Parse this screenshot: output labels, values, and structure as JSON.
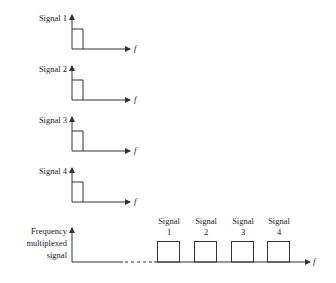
{
  "signals": [
    {
      "label": "Signal 1",
      "axis_label": "f"
    },
    {
      "label": "Signal 2",
      "axis_label": "f"
    },
    {
      "label": "Signal 3",
      "axis_label": "f"
    },
    {
      "label": "Signal 4",
      "axis_label": "f"
    }
  ],
  "multiplexed": {
    "label_lines": [
      "Frequency",
      "multiplexed",
      "signal"
    ],
    "axis_label": "f",
    "bands": [
      {
        "line1": "Signal",
        "line2": "1"
      },
      {
        "line1": "Signal",
        "line2": "2"
      },
      {
        "line1": "Signal",
        "line2": "3"
      },
      {
        "line1": "Signal",
        "line2": "4"
      }
    ]
  },
  "colors": {
    "line": "#333333",
    "text": "#222222"
  }
}
